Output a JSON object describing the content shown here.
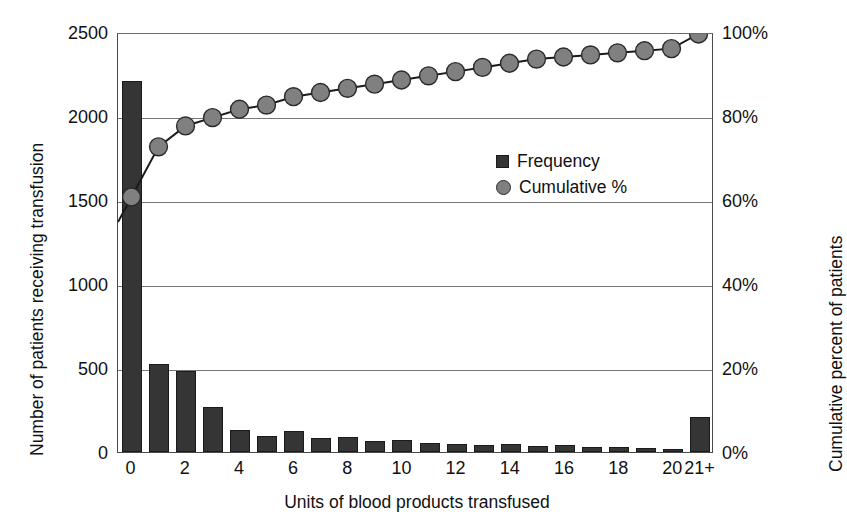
{
  "chart_data": {
    "type": "bar",
    "title": "",
    "xlabel": "Units of blood products transfused",
    "ylabel": "Number of patients receiving transfusion",
    "y2label": "Cumulative percent of patients",
    "categories": [
      "0",
      "1",
      "2",
      "3",
      "4",
      "5",
      "6",
      "7",
      "8",
      "9",
      "10",
      "11",
      "12",
      "13",
      "14",
      "15",
      "16",
      "17",
      "18",
      "19",
      "20",
      "21+"
    ],
    "xtick_labels": [
      "0",
      "2",
      "4",
      "6",
      "8",
      "10",
      "12",
      "14",
      "16",
      "18",
      "20",
      "21+"
    ],
    "xtick_categories": [
      "0",
      "2",
      "4",
      "6",
      "8",
      "10",
      "12",
      "14",
      "16",
      "18",
      "20",
      "21+"
    ],
    "ylim": [
      0,
      2500
    ],
    "ytick_labels": [
      "0",
      "500",
      "1000",
      "1500",
      "2000",
      "2500"
    ],
    "ytick_values": [
      0,
      500,
      1000,
      1500,
      2000,
      2500
    ],
    "y2lim": [
      0,
      100
    ],
    "y2tick_labels": [
      "0%",
      "20%",
      "40%",
      "60%",
      "80%",
      "100%"
    ],
    "y2tick_values": [
      0,
      20,
      40,
      60,
      80,
      100
    ],
    "grid": true,
    "legend_position": "center-right-inside",
    "series": [
      {
        "name": "Frequency",
        "type": "bar",
        "axis": "left",
        "color": "#353535",
        "values": [
          2210,
          525,
          480,
          270,
          130,
          95,
          125,
          85,
          90,
          65,
          70,
          55,
          50,
          40,
          45,
          35,
          40,
          30,
          30,
          25,
          20,
          210
        ]
      },
      {
        "name": "Cumulative %",
        "type": "line",
        "axis": "right",
        "color": "#808080",
        "values": [
          61,
          73,
          78,
          80,
          82,
          83,
          85,
          86,
          87,
          88,
          89,
          90,
          91,
          92,
          93,
          94,
          94.5,
          95,
          95.5,
          96,
          96.5,
          100
        ]
      }
    ]
  },
  "legend": {
    "items": [
      {
        "label": "Frequency",
        "marker": "square",
        "color": "#353535"
      },
      {
        "label": "Cumulative %",
        "marker": "circle",
        "color": "#808080"
      }
    ]
  },
  "axes": {
    "left_title": "Number of patients receiving transfusion",
    "right_title": "Cumulative percent of patients",
    "bottom_title": "Units of blood products transfused"
  },
  "colors": {
    "bar": "#353535",
    "marker": "#808080",
    "line": "#1a1a1a",
    "grid": "#777777",
    "frame": "#4a4a4a",
    "background": "#ffffff"
  }
}
